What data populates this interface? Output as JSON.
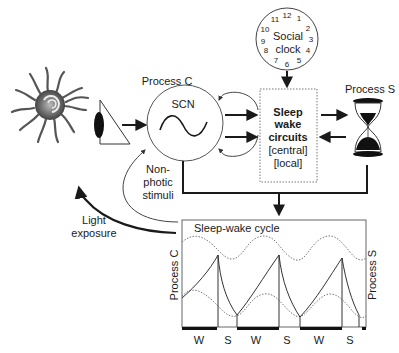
{
  "diagram": {
    "sun": {
      "label": ""
    },
    "eye": {
      "label": ""
    },
    "process_c": {
      "title": "Process C",
      "circle_label": "SCN"
    },
    "social_clock": {
      "label_line1": "Social",
      "label_line2": "clock",
      "numbers": [
        "12",
        "1",
        "2",
        "3",
        "4",
        "5",
        "6",
        "7",
        "8",
        "9",
        "10",
        "11"
      ]
    },
    "sleep_wake_circuits": {
      "line1": "Sleep",
      "line2": "wake",
      "line3": "circuits",
      "line4": "[central]",
      "line5": "[local]"
    },
    "process_s": {
      "title": "Process S"
    },
    "non_photic": {
      "line1": "Non-",
      "line2": "photic",
      "line3": "stimuli"
    },
    "light_exposure": {
      "line1": "Light",
      "line2": "exposure"
    },
    "cycle_panel": {
      "title": "Sleep-wake cycle",
      "left_axis": "Process C",
      "right_axis": "Process S",
      "states": [
        "W",
        "S",
        "W",
        "S",
        "W",
        "S"
      ]
    }
  },
  "colors": {
    "ink": "#1a1a1a",
    "line_gray": "#555555",
    "dotted": "#777777",
    "background": "#ffffff"
  }
}
